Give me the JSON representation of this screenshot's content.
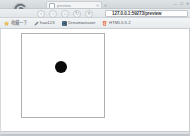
{
  "window": {
    "controls": [
      {
        "name": "minimize-button",
        "glyph": "—"
      },
      {
        "name": "maximize-button",
        "glyph": "□"
      },
      {
        "name": "close-button",
        "glyph": "✕"
      }
    ]
  },
  "tabstrip": {
    "tab": {
      "title": "preview",
      "close_glyph": "✕"
    },
    "new_tab_glyph": "+"
  },
  "logo": {
    "icon_name": "browser-swirl-logo",
    "accent": "#5a6166"
  },
  "toolbar": {
    "buttons": [
      {
        "name": "back-button",
        "glyph": "‹",
        "title": "后退"
      },
      {
        "name": "forward-button",
        "glyph": "›",
        "title": "前进"
      },
      {
        "name": "home-button",
        "glyph": "⌂",
        "title": "主页"
      },
      {
        "name": "refresh-button",
        "glyph": "↻",
        "title": "刷新"
      },
      {
        "name": "stop-button",
        "glyph": "✕",
        "title": "停止"
      }
    ],
    "address": {
      "value": "127.0.0.1:59273/preview",
      "placeholder": "输入网址",
      "lock_icon": "page-icon"
    }
  },
  "bookmarks": {
    "items": [
      {
        "icon": "star-icon",
        "label": "收藏一下"
      },
      {
        "icon": "pen-icon",
        "label": "hao123"
      },
      {
        "icon": "dreamweaver-icon",
        "label": "Dreamweaver"
      },
      {
        "icon": "html5-icon",
        "label": "HTML5.5.2"
      }
    ]
  },
  "content": {
    "canvas": {
      "name": "drawing-canvas",
      "shape": {
        "type": "circle",
        "color": "#0a0a0a",
        "center_x": 39,
        "center_y": 33,
        "radius": 6
      }
    }
  }
}
